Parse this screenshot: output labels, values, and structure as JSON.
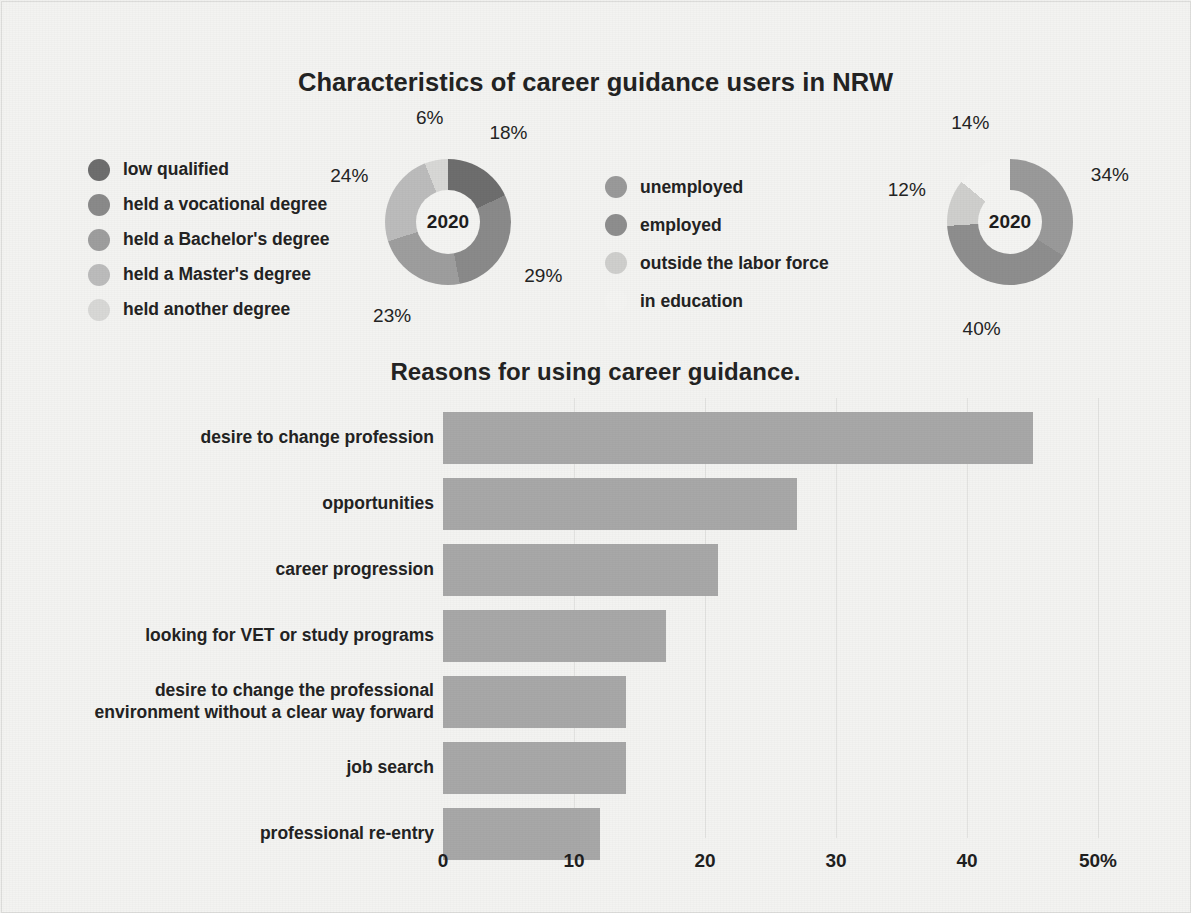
{
  "figure": {
    "title": "Characteristics of career guidance users in NRW",
    "bar_title": "Reasons for using career guidance."
  },
  "donut_left": {
    "center_label": "2020",
    "legend": [
      {
        "label": "low qualified",
        "color": "#6e6e6e"
      },
      {
        "label": "held a vocational degree",
        "color": "#8a8a8a"
      },
      {
        "label": "held a Bachelor's degree",
        "color": "#9e9e9e"
      },
      {
        "label": "held a Master's degree",
        "color": "#bcbcbc"
      },
      {
        "label": "held another degree",
        "color": "#d8d8d6"
      }
    ]
  },
  "donut_right": {
    "center_label": "2020",
    "legend": [
      {
        "label": "unemployed",
        "color": "#9a9a9a"
      },
      {
        "label": "employed",
        "color": "#8e8e8e"
      },
      {
        "label": "outside the labor force",
        "color": "#cfcfcd"
      },
      {
        "label": "in education",
        "color": "#f4f4f2"
      }
    ]
  },
  "axis": {
    "ticks": [
      "0",
      "10",
      "20",
      "30",
      "40",
      "50%"
    ]
  },
  "colors": {
    "background": "#f3f3f1",
    "bar": "#a8a8a8",
    "text": "#232323",
    "gridline": "#e2e2e0"
  },
  "chart_data": [
    {
      "type": "pie",
      "title": "Characteristics of career guidance users in NRW",
      "subtitle": "2020",
      "legend_position": "left",
      "labels": [
        "low qualified",
        "held a vocational degree",
        "held a Bachelor's degree",
        "held a Master's degree",
        "held another degree"
      ],
      "values": [
        18,
        29,
        23,
        24,
        6
      ],
      "value_labels": [
        "18%",
        "29%",
        "23%",
        "24%",
        "6%"
      ],
      "colors": [
        "#6e6e6e",
        "#8a8a8a",
        "#9e9e9e",
        "#bcbcbc",
        "#d8d8d6"
      ]
    },
    {
      "type": "pie",
      "title": "Characteristics of career guidance users in NRW",
      "subtitle": "2020",
      "legend_position": "left",
      "labels": [
        "unemployed",
        "employed",
        "outside the labor force",
        "in education"
      ],
      "values": [
        34,
        40,
        12,
        14
      ],
      "value_labels": [
        "34%",
        "40%",
        "12%",
        "14%"
      ],
      "colors": [
        "#9a9a9a",
        "#8e8e8e",
        "#cfcfcd",
        "#f4f4f2"
      ]
    },
    {
      "type": "bar",
      "orientation": "horizontal",
      "title": "Reasons for using career guidance.",
      "xlabel": "",
      "ylabel": "",
      "xlim": [
        0,
        50
      ],
      "xticks": [
        0,
        10,
        20,
        30,
        40,
        50
      ],
      "xtick_labels": [
        "0",
        "10",
        "20",
        "30",
        "40",
        "50%"
      ],
      "grid": true,
      "categories": [
        "desire to change profession",
        "opportunities",
        "career progression",
        "looking for VET or study programs",
        "desire to change the professional environment without a clear way forward",
        "job search",
        "professional re-entry"
      ],
      "values": [
        45,
        27,
        21,
        17,
        14,
        14,
        12
      ]
    }
  ],
  "bars": [
    {
      "label": "desire to change profession",
      "value": 45
    },
    {
      "label": "opportunities",
      "value": 27
    },
    {
      "label": "career progression",
      "value": 21
    },
    {
      "label": "looking for VET or study programs",
      "value": 17
    },
    {
      "label": "desire to change the professional\nenvironment without a clear way forward",
      "value": 14
    },
    {
      "label": "job search",
      "value": 14
    },
    {
      "label": "professional re-entry",
      "value": 12
    }
  ]
}
